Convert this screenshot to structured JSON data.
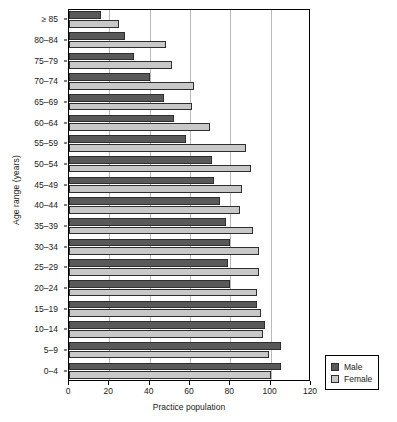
{
  "chart_data": {
    "type": "bar",
    "orientation": "horizontal",
    "title": "",
    "xlabel": "Practice population",
    "ylabel": "Age range (years)",
    "xlim": [
      0,
      120
    ],
    "xticks": [
      0,
      20,
      40,
      60,
      80,
      100,
      120
    ],
    "grid": true,
    "legend_position": "bottom-right",
    "categories": [
      "≥ 85",
      "80–84",
      "75–79",
      "70–74",
      "65–69",
      "60–64",
      "55–59",
      "50–54",
      "45–49",
      "40–44",
      "35–39",
      "30–34",
      "25–29",
      "20–24",
      "15–19",
      "10–14",
      "5–9",
      "0–4"
    ],
    "series": [
      {
        "name": "Male",
        "color": "#595959",
        "values": [
          16,
          28,
          32,
          40,
          47,
          52,
          58,
          71,
          72,
          75,
          78,
          80,
          79,
          80,
          93,
          97,
          105,
          105
        ]
      },
      {
        "name": "Female",
        "color": "#c8c8c8",
        "values": [
          25,
          48,
          51,
          62,
          61,
          70,
          88,
          90,
          86,
          85,
          91,
          94,
          94,
          93,
          95,
          96,
          99,
          100
        ]
      }
    ]
  },
  "legend": {
    "items": [
      {
        "label": "Male",
        "color": "#595959"
      },
      {
        "label": "Female",
        "color": "#c8c8c8"
      }
    ]
  }
}
